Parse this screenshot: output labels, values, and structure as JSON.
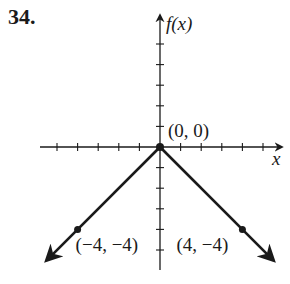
{
  "problem_number": "34.",
  "chart_data": {
    "type": "line",
    "title": "",
    "xlabel": "x",
    "ylabel": "f(x)",
    "xlim": [
      -5,
      5
    ],
    "ylim": [
      -5,
      5
    ],
    "grid": false,
    "ticks_every": 1,
    "series": [
      {
        "name": "f(x) = -|x|",
        "x": [
          -5.5,
          -4,
          0,
          4,
          5.5
        ],
        "y": [
          -5.5,
          -4,
          0,
          -4,
          -5.5
        ],
        "arrows_on_ends": true
      }
    ],
    "labeled_points": [
      {
        "label": "(0, 0)",
        "x": 0,
        "y": 0
      },
      {
        "label": "(−4, −4)",
        "x": -4,
        "y": -4
      },
      {
        "label": "(4, −4)",
        "x": 4,
        "y": -4
      }
    ]
  },
  "colors": {
    "ink": "#1a1a1a",
    "background": "#ffffff"
  }
}
